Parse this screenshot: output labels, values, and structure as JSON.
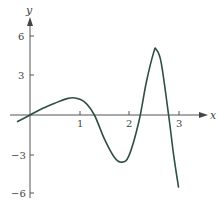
{
  "chart_data": {
    "type": "line",
    "title": "",
    "xlabel": "x",
    "ylabel": "y",
    "xlim": [
      -0.25,
      3.4
    ],
    "ylim": [
      -6.5,
      7
    ],
    "x_ticks": [
      "1",
      "2",
      "3"
    ],
    "y_ticks": [
      "6",
      "3",
      "-3",
      "-6"
    ],
    "grid": false,
    "series": [
      {
        "name": "f(x)",
        "color": "#2f4f45",
        "x": [
          -0.25,
          0,
          0.25,
          0.5,
          0.75,
          0.9,
          1.1,
          1.3,
          1.5,
          1.7,
          1.85,
          2.0,
          2.2,
          2.35,
          2.5,
          2.55,
          2.65,
          2.8,
          2.9,
          3.0
        ],
        "y": [
          -0.5,
          0,
          0.5,
          0.9,
          1.25,
          1.3,
          1.0,
          0,
          -1.8,
          -3.2,
          -3.6,
          -3.1,
          -0.5,
          2.5,
          4.8,
          5.0,
          4.0,
          0,
          -3.0,
          -5.5
        ]
      }
    ]
  },
  "labels": {
    "x_axis": "x",
    "y_axis": "y",
    "tick_x1": "1",
    "tick_x2": "2",
    "tick_x3": "3",
    "tick_y6": "6",
    "tick_y3": "3",
    "tick_yn3": "−3",
    "tick_yn6": "−6"
  }
}
